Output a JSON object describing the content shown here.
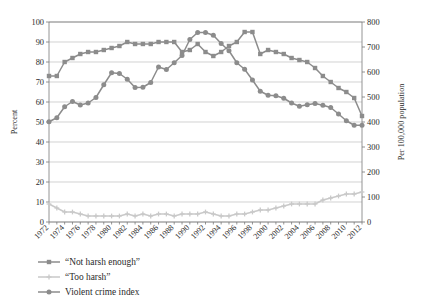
{
  "chart_data": {
    "type": "line",
    "title": "",
    "subtitle": "",
    "xlabel": "",
    "ylabel": "Percent",
    "y2label": "Per 100,000 population",
    "xlim": [
      1972,
      2012
    ],
    "ylim": [
      0,
      100
    ],
    "y2lim": [
      0,
      800
    ],
    "grid": true,
    "legend_position": "below-left",
    "xticks": [
      1972,
      1974,
      1976,
      1978,
      1980,
      1982,
      1984,
      1986,
      1988,
      1990,
      1992,
      1994,
      1996,
      1998,
      2000,
      2002,
      2004,
      2006,
      2008,
      2010,
      2012
    ],
    "xtick_labels": [
      "1972",
      "1974",
      "1976",
      "1978",
      "1980",
      "1982",
      "1984",
      "1986",
      "1988",
      "1990",
      "1992",
      "1994",
      "1996",
      "1998",
      "2000",
      "2002",
      "2004",
      "2006",
      "2008",
      "2010",
      "2012"
    ],
    "yticks": [
      0,
      10,
      20,
      30,
      40,
      50,
      60,
      70,
      80,
      90,
      100
    ],
    "ytick_labels": [
      "0",
      "10",
      "20",
      "30",
      "40",
      "50",
      "60",
      "70",
      "80",
      "90",
      "100"
    ],
    "y2ticks": [
      0,
      100,
      200,
      300,
      400,
      500,
      600,
      700,
      800
    ],
    "y2tick_labels": [
      "0",
      "100",
      "200",
      "300",
      "400",
      "500",
      "600",
      "700",
      "800"
    ],
    "x": [
      1972,
      1973,
      1974,
      1975,
      1976,
      1977,
      1978,
      1979,
      1980,
      1981,
      1982,
      1983,
      1984,
      1985,
      1986,
      1987,
      1988,
      1989,
      1990,
      1991,
      1992,
      1993,
      1994,
      1995,
      1996,
      1997,
      1998,
      1999,
      2000,
      2001,
      2002,
      2003,
      2004,
      2005,
      2006,
      2007,
      2008,
      2009,
      2010,
      2011,
      2012
    ],
    "series": [
      {
        "name": "“Not harsh enough”",
        "axis": "left",
        "color": "#8c8c8c",
        "marker": "square",
        "values": [
          73,
          73,
          80,
          82,
          84,
          85,
          85,
          86,
          87,
          88,
          90,
          89,
          89,
          89,
          90,
          90,
          90,
          85,
          86,
          89,
          85,
          83,
          85,
          88,
          90,
          95,
          95,
          84,
          86,
          85,
          84,
          82,
          81,
          80,
          77,
          73,
          70,
          67,
          65,
          62,
          53
        ],
        "values_note": "percent responding courts not harsh enough"
      },
      {
        "name": "“Too harsh”",
        "axis": "left",
        "color": "#c9c9c9",
        "marker": "plus",
        "values": [
          9,
          7,
          5,
          5,
          4,
          3,
          3,
          3,
          3,
          3,
          4,
          3,
          4,
          3,
          4,
          4,
          3,
          4,
          4,
          4,
          5,
          4,
          3,
          3,
          4,
          4,
          5,
          6,
          6,
          7,
          8,
          9,
          9,
          9,
          9,
          11,
          12,
          13,
          14,
          14,
          15
        ]
      },
      {
        "name": "Violent crime index",
        "axis": "right",
        "color": "#8c8c8c",
        "marker": "circle",
        "values": [
          401,
          417,
          461,
          482,
          468,
          476,
          498,
          549,
          597,
          594,
          571,
          538,
          539,
          558,
          620,
          610,
          637,
          666,
          730,
          758,
          758,
          747,
          714,
          685,
          637,
          611,
          568,
          523,
          507,
          505,
          495,
          476,
          463,
          469,
          474,
          467,
          458,
          432,
          405,
          387,
          387
        ]
      }
    ],
    "legend": [
      {
        "label": "“Not harsh enough”",
        "color": "#8c8c8c",
        "marker": "square"
      },
      {
        "label": "“Too harsh”",
        "color": "#c9c9c9",
        "marker": "plus"
      },
      {
        "label": "Violent crime index",
        "color": "#8c8c8c",
        "marker": "circle"
      }
    ],
    "colors": {
      "not_harsh_enough": "#8c8c8c",
      "too_harsh": "#c9c9c9",
      "violent_crime_index": "#8c8c8c",
      "gridline": "#bfbfbf",
      "axis": "#7a7a7a",
      "text": "#2b2b2b",
      "background": "#ffffff"
    }
  }
}
